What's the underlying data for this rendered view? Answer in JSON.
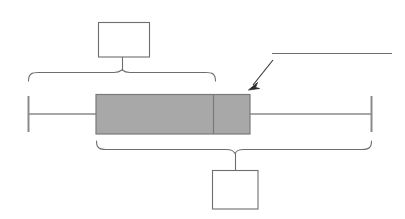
{
  "diagram": {
    "type": "box-and-whisker-plot-annotated",
    "title": "",
    "background_color": "#ffffff",
    "stroke_color": "#6e6e6e",
    "box_fill_color": "#a8a8a8",
    "box_border_color": "#7a7a7a",
    "arrow_color": "#3a3a3a",
    "label_box_border_color": "#6e6e6e",
    "label_box_fill_color": "#ffffff"
  },
  "boxplot": {
    "name": "box-and-whisker-plot",
    "axis_y": 114,
    "whisker_min_x": 28,
    "box_left_x": 96,
    "median_x": 213,
    "box_right_x": 250,
    "whisker_max_x": 371,
    "box_top_y": 94,
    "box_bottom_y": 134,
    "cap_top_y": 96,
    "cap_bottom_y": 132,
    "parts": [
      {
        "name": "lower-whisker-cap",
        "label": ""
      },
      {
        "name": "lower-whisker-line",
        "label": ""
      },
      {
        "name": "box-lower-quartile-to-median",
        "label": ""
      },
      {
        "name": "median-line",
        "label": ""
      },
      {
        "name": "box-median-to-upper-quartile",
        "label": ""
      },
      {
        "name": "upper-whisker-line",
        "label": ""
      },
      {
        "name": "upper-whisker-cap",
        "label": ""
      }
    ]
  },
  "callouts": {
    "top": {
      "name": "top-callout",
      "label": "",
      "box": {
        "x": 98,
        "y": 22,
        "width": 52,
        "height": 35
      },
      "stem": {
        "x": 122,
        "from_y": 57,
        "to_y": 72
      },
      "brace": {
        "left_x": 28,
        "right_x": 215,
        "peak_x": 122,
        "y": 80,
        "peak_y": 70,
        "direction": "up"
      }
    },
    "bottom": {
      "name": "bottom-callout",
      "label": "",
      "box": {
        "x": 212,
        "y": 170,
        "width": 46,
        "height": 39
      },
      "stem": {
        "x": 235,
        "from_y": 155,
        "to_y": 170
      },
      "brace": {
        "left_x": 96,
        "right_x": 371,
        "peak_x": 235,
        "y": 142,
        "peak_y": 155,
        "direction": "down"
      }
    },
    "pointer": {
      "name": "arrow-callout",
      "label": "",
      "arrow_from": {
        "x": 273,
        "y": 60
      },
      "arrow_to": {
        "x": 249,
        "y": 89
      },
      "underline": {
        "x1": 272,
        "x2": 392,
        "y": 53
      }
    }
  }
}
